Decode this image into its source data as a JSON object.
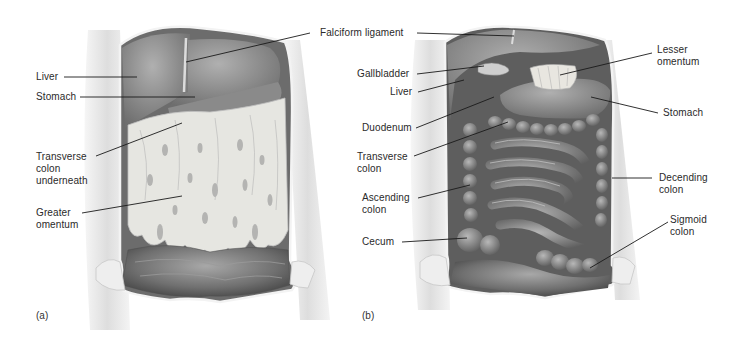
{
  "figure": {
    "panels": [
      {
        "id": "a",
        "tag": "(a)",
        "labels": [
          {
            "text": "Liver"
          },
          {
            "text": "Stomach"
          },
          {
            "text": "Transverse\ncolon\nunderneath"
          },
          {
            "text": "Greater\nomentum"
          }
        ]
      },
      {
        "id": "b",
        "tag": "(b)",
        "labels": [
          {
            "text": "Falciform ligament"
          },
          {
            "text": "Gallbladder"
          },
          {
            "text": "Liver"
          },
          {
            "text": "Duodenum"
          },
          {
            "text": "Transverse\ncolon"
          },
          {
            "text": "Ascending\ncolon"
          },
          {
            "text": "Cecum"
          },
          {
            "text": "Lesser\nomentum"
          },
          {
            "text": "Stomach"
          },
          {
            "text": "Decending\ncolon"
          },
          {
            "text": "Sigmoid\ncolon"
          }
        ]
      }
    ],
    "colors": {
      "background": "#ffffff",
      "body_wall": "#d9d9d9",
      "cavity_dark": "#6a6a6a",
      "organ_mid": "#8c8c8c",
      "omentum": "#e4e4e0",
      "leader_line": "#1a1a1a"
    }
  }
}
